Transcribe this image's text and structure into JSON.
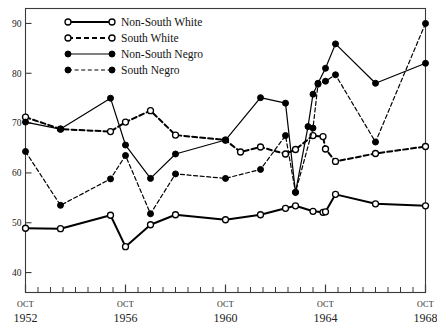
{
  "chart_data": {
    "type": "line",
    "title": "",
    "subtitle": "",
    "xlabel": "",
    "ylabel": "",
    "xlim": [
      1952.0,
      1968.0
    ],
    "ylim": [
      36.0,
      93.0
    ],
    "yticks": [
      40,
      50,
      60,
      70,
      80,
      90
    ],
    "yticklabels": [
      "40",
      "50",
      "60",
      "70",
      "80",
      "90"
    ],
    "grid": false,
    "legend_position": "top-left-inside",
    "x_axis_major_labels": [
      {
        "top": "OCT",
        "year": "1952",
        "x": 1952.0
      },
      {
        "top": "OCT",
        "year": "1956",
        "x": 1956.0
      },
      {
        "top": "OCT",
        "year": "1960",
        "x": 1960.0
      },
      {
        "top": "OCT",
        "year": "1964",
        "x": 1964.0
      },
      {
        "top": "OCT",
        "year": "1968",
        "x": 1968.0
      }
    ],
    "x_minor_ticks": [
      1952.5,
      1953.0,
      1953.5,
      1954.0,
      1954.5,
      1955.0,
      1955.5,
      1956.5,
      1957.0,
      1957.5,
      1958.0,
      1958.5,
      1959.0,
      1959.5,
      1960.5,
      1961.0,
      1961.5,
      1962.0,
      1962.5,
      1963.0,
      1963.5,
      1964.5,
      1965.0,
      1965.5,
      1966.0,
      1966.5,
      1967.0,
      1967.5
    ],
    "series": [
      {
        "name": "Non-South White",
        "legend_label": "Non-South White",
        "marker": "open-circle",
        "line": "solid",
        "line_width": 2.0,
        "color": "#000000",
        "points": [
          {
            "x": 1952.0,
            "y": 48.9
          },
          {
            "x": 1953.4,
            "y": 48.8
          },
          {
            "x": 1955.4,
            "y": 51.5
          },
          {
            "x": 1956.0,
            "y": 45.2
          },
          {
            "x": 1957.0,
            "y": 49.6
          },
          {
            "x": 1958.0,
            "y": 51.6
          },
          {
            "x": 1960.0,
            "y": 50.6
          },
          {
            "x": 1961.4,
            "y": 51.6
          },
          {
            "x": 1962.4,
            "y": 52.9
          },
          {
            "x": 1962.8,
            "y": 53.4
          },
          {
            "x": 1963.5,
            "y": 52.3
          },
          {
            "x": 1963.9,
            "y": 52.1
          },
          {
            "x": 1964.0,
            "y": 52.2
          },
          {
            "x": 1964.4,
            "y": 55.7
          },
          {
            "x": 1966.0,
            "y": 53.8
          },
          {
            "x": 1968.0,
            "y": 53.4
          }
        ]
      },
      {
        "name": "South White",
        "legend_label": "South White",
        "marker": "open-circle",
        "line": "dashed",
        "line_width": 2.0,
        "color": "#000000",
        "points": [
          {
            "x": 1952.0,
            "y": 71.2
          },
          {
            "x": 1953.4,
            "y": 68.8
          },
          {
            "x": 1955.4,
            "y": 68.3
          },
          {
            "x": 1956.0,
            "y": 70.2
          },
          {
            "x": 1957.0,
            "y": 72.5
          },
          {
            "x": 1958.0,
            "y": 67.6
          },
          {
            "x": 1960.0,
            "y": 66.6
          },
          {
            "x": 1960.6,
            "y": 64.2
          },
          {
            "x": 1961.4,
            "y": 65.2
          },
          {
            "x": 1962.4,
            "y": 63.8
          },
          {
            "x": 1962.8,
            "y": 64.7
          },
          {
            "x": 1963.5,
            "y": 67.5
          },
          {
            "x": 1963.9,
            "y": 67.3
          },
          {
            "x": 1964.0,
            "y": 64.8
          },
          {
            "x": 1964.4,
            "y": 62.3
          },
          {
            "x": 1966.0,
            "y": 63.9
          },
          {
            "x": 1968.0,
            "y": 65.3
          }
        ]
      },
      {
        "name": "Non-South Negro",
        "legend_label": "Non-South Negro",
        "marker": "filled-circle",
        "line": "solid",
        "line_width": 1.2,
        "color": "#000000",
        "points": [
          {
            "x": 1952.0,
            "y": 70.2
          },
          {
            "x": 1953.4,
            "y": 68.8
          },
          {
            "x": 1955.4,
            "y": 75.0
          },
          {
            "x": 1956.0,
            "y": 65.6
          },
          {
            "x": 1957.0,
            "y": 58.9
          },
          {
            "x": 1958.0,
            "y": 63.8
          },
          {
            "x": 1960.0,
            "y": 66.6
          },
          {
            "x": 1961.4,
            "y": 75.1
          },
          {
            "x": 1962.4,
            "y": 74.0
          },
          {
            "x": 1962.8,
            "y": 56.1
          },
          {
            "x": 1963.3,
            "y": 69.3
          },
          {
            "x": 1963.5,
            "y": 75.8
          },
          {
            "x": 1963.7,
            "y": 78.0
          },
          {
            "x": 1664.0,
            "y": 81.0
          },
          {
            "x": 1964.0,
            "y": 81.0
          },
          {
            "x": 1964.4,
            "y": 85.9
          },
          {
            "x": 1966.0,
            "y": 78.0
          },
          {
            "x": 1968.0,
            "y": 82.0
          }
        ]
      },
      {
        "name": "South Negro",
        "legend_label": "South Negro",
        "marker": "filled-circle",
        "line": "dashed",
        "line_width": 1.2,
        "color": "#000000",
        "points": [
          {
            "x": 1952.0,
            "y": 64.3
          },
          {
            "x": 1953.4,
            "y": 53.5
          },
          {
            "x": 1955.4,
            "y": 58.8
          },
          {
            "x": 1956.0,
            "y": 63.5
          },
          {
            "x": 1957.0,
            "y": 51.8
          },
          {
            "x": 1958.0,
            "y": 59.8
          },
          {
            "x": 1960.0,
            "y": 58.9
          },
          {
            "x": 1961.4,
            "y": 60.7
          },
          {
            "x": 1962.4,
            "y": 67.5
          },
          {
            "x": 1962.8,
            "y": 56.1
          },
          {
            "x": 1963.5,
            "y": 69.0
          },
          {
            "x": 1963.7,
            "y": 77.8
          },
          {
            "x": 1964.0,
            "y": 78.4
          },
          {
            "x": 1964.4,
            "y": 79.7
          },
          {
            "x": 1966.0,
            "y": 66.2
          },
          {
            "x": 1968.0,
            "y": 90.0
          }
        ]
      }
    ]
  }
}
